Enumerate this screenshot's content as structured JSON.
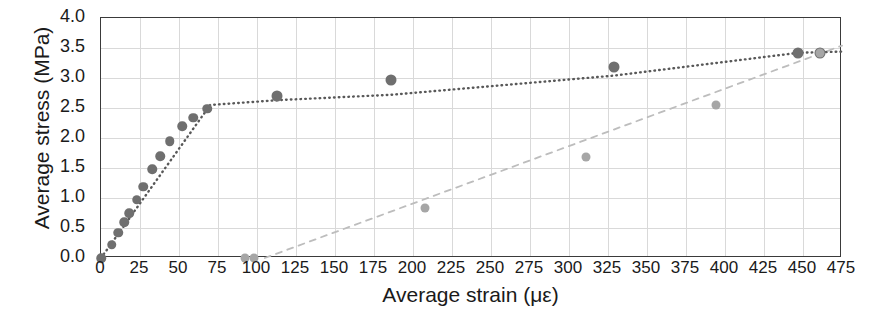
{
  "chart_data": {
    "type": "scatter",
    "title": "",
    "xlabel": "Average strain (με)",
    "ylabel": "Average stress (MPa)",
    "xlim": [
      0,
      475
    ],
    "ylim": [
      0.0,
      4.0
    ],
    "xticks": [
      0,
      25,
      50,
      75,
      100,
      125,
      150,
      175,
      200,
      225,
      250,
      275,
      300,
      325,
      350,
      375,
      400,
      425,
      450,
      475
    ],
    "yticks": [
      "0.0",
      "0.5",
      "1.0",
      "1.5",
      "2.0",
      "2.5",
      "3.0",
      "3.5",
      "4.0"
    ],
    "xtick_labels": [
      "0",
      "25",
      "50",
      "75",
      "100",
      "125",
      "150",
      "175",
      "200",
      "225",
      "250",
      "275",
      "300",
      "325",
      "350",
      "375",
      "400",
      "425",
      "450",
      "475"
    ],
    "grid": true,
    "legend": "none",
    "series": [
      {
        "name": "dark-series",
        "color": "#6f6f6f",
        "linestyle": "dotted",
        "marker": "circle",
        "points": [
          {
            "x": 0,
            "y": 0.0
          },
          {
            "x": 7,
            "y": 0.22
          },
          {
            "x": 11,
            "y": 0.42
          },
          {
            "x": 15,
            "y": 0.6
          },
          {
            "x": 18,
            "y": 0.75
          },
          {
            "x": 23,
            "y": 0.97
          },
          {
            "x": 27,
            "y": 1.19
          },
          {
            "x": 33,
            "y": 1.48
          },
          {
            "x": 38,
            "y": 1.7
          },
          {
            "x": 44,
            "y": 1.95
          },
          {
            "x": 52,
            "y": 2.2
          },
          {
            "x": 59,
            "y": 2.34
          },
          {
            "x": 68,
            "y": 2.49
          },
          {
            "x": 113,
            "y": 2.7
          },
          {
            "x": 186,
            "y": 2.96
          },
          {
            "x": 329,
            "y": 3.18
          },
          {
            "x": 447,
            "y": 3.42
          },
          {
            "x": 461,
            "y": 3.42
          }
        ]
      },
      {
        "name": "light-series",
        "color": "#a6a6a6",
        "linestyle": "dashed",
        "marker": "circle",
        "points": [
          {
            "x": 92,
            "y": 0.0
          },
          {
            "x": 98,
            "y": 0.0
          },
          {
            "x": 208,
            "y": 0.83
          },
          {
            "x": 311,
            "y": 1.68
          },
          {
            "x": 394,
            "y": 2.55
          },
          {
            "x": 461,
            "y": 3.42
          }
        ]
      }
    ],
    "trendlines": [
      {
        "name": "dark-trend",
        "color": "#585858",
        "style": "dotted",
        "vertices": [
          {
            "x": 0,
            "y": 0.0
          },
          {
            "x": 70,
            "y": 2.55
          },
          {
            "x": 113,
            "y": 2.63
          },
          {
            "x": 186,
            "y": 2.72
          },
          {
            "x": 329,
            "y": 3.04
          },
          {
            "x": 447,
            "y": 3.42
          },
          {
            "x": 475,
            "y": 3.44
          }
        ]
      },
      {
        "name": "light-trend",
        "color": "#bdbdbd",
        "style": "dashed",
        "vertices": [
          {
            "x": 105,
            "y": 0.0
          },
          {
            "x": 475,
            "y": 3.54
          }
        ]
      }
    ]
  }
}
